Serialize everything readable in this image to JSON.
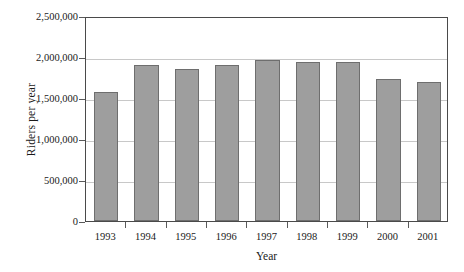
{
  "chart_data": {
    "type": "bar",
    "title": "",
    "subtitle": "",
    "xlabel": "Year",
    "ylabel": "Riders per year",
    "categories": [
      "1993",
      "1994",
      "1995",
      "1996",
      "1997",
      "1998",
      "1999",
      "2000",
      "2001"
    ],
    "values": [
      1570000,
      1905000,
      1850000,
      1900000,
      1960000,
      1935000,
      1935000,
      1735000,
      1695000
    ],
    "ylim": [
      0,
      2500000
    ],
    "yticks": [
      0,
      500000,
      1000000,
      1500000,
      2000000,
      2500000
    ],
    "ytick_labels": [
      "0",
      "500,000",
      "1,000,000",
      "1,500,000",
      "2,000,000",
      "2,500,000"
    ],
    "grid": true,
    "grid_axis": "y",
    "legend": false,
    "legend_position": "none",
    "annotations": [],
    "series": [
      {
        "name": "Riders per year",
        "values": [
          1570000,
          1905000,
          1850000,
          1900000,
          1960000,
          1935000,
          1935000,
          1735000,
          1695000
        ]
      }
    ]
  },
  "style": {
    "bar_fill": "#9e9e9e",
    "bar_border": "#6e6e6e",
    "gridline_color": "#c8c8c8",
    "axis_color": "#4a4a4a",
    "text_color": "#1a1a1a",
    "background": "#ffffff"
  }
}
